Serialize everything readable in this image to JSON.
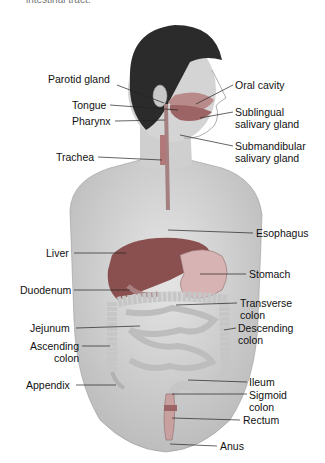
{
  "caption": "intestinal tract.",
  "diagram": {
    "labels_left": [
      {
        "id": "parotid-gland",
        "text": "Parotid gland",
        "x": 48,
        "y": 79
      },
      {
        "id": "tongue",
        "text": "Tongue",
        "x": 72,
        "y": 99
      },
      {
        "id": "pharynx",
        "text": "Pharynx",
        "x": 72,
        "y": 115
      },
      {
        "id": "trachea",
        "text": "Trachea",
        "x": 56,
        "y": 151
      },
      {
        "id": "liver",
        "text": "Liver",
        "x": 46,
        "y": 247
      },
      {
        "id": "duodenum",
        "text": "Duodenum",
        "x": 20,
        "y": 284
      },
      {
        "id": "jejunum",
        "text": "Jejunum",
        "x": 30,
        "y": 322
      },
      {
        "id": "ascending-colon",
        "text": "Ascending",
        "text2": "colon",
        "x": 30,
        "y": 337
      },
      {
        "id": "appendix",
        "text": "Appendix",
        "x": 26,
        "y": 379
      }
    ],
    "labels_right": [
      {
        "id": "oral-cavity",
        "text": "Oral cavity",
        "x": 235,
        "y": 79
      },
      {
        "id": "sublingual-salivary-gland",
        "text": "Sublingual",
        "text2": "salivary gland",
        "x": 235,
        "y": 106
      },
      {
        "id": "submandibular-salivary-gland",
        "text": "Submandibular",
        "text2": "salivary gland",
        "x": 235,
        "y": 140
      },
      {
        "id": "esophagus",
        "text": "Esophagus",
        "x": 256,
        "y": 227
      },
      {
        "id": "stomach",
        "text": "Stomach",
        "x": 249,
        "y": 268
      },
      {
        "id": "transverse-colon",
        "text": "Transverse",
        "text2": "colon",
        "x": 240,
        "y": 297
      },
      {
        "id": "descending-colon",
        "text": "Descending",
        "text2": "colon",
        "x": 238,
        "y": 322
      },
      {
        "id": "ileum",
        "text": "Ileum",
        "x": 249,
        "y": 376
      },
      {
        "id": "sigmoid-colon",
        "text": "Sigmoid",
        "text2": "colon",
        "x": 249,
        "y": 389
      },
      {
        "id": "rectum",
        "text": "Rectum",
        "x": 243,
        "y": 414
      },
      {
        "id": "anus",
        "text": "Anus",
        "x": 220,
        "y": 440
      }
    ]
  },
  "colors": {
    "skin": "#d6d6d6",
    "skin_shadow": "#c2c2c2",
    "hair": "#2b2b2b",
    "organ_red": "#a06060",
    "liver": "#8a4f4f",
    "stomach": "#c9a0a0",
    "intestine": "#d8d8d8",
    "leader": "#222222"
  }
}
